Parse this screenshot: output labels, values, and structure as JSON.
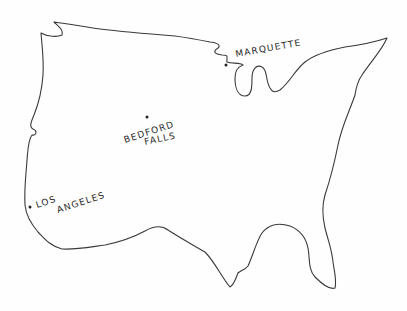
{
  "map": {
    "title": "",
    "style": "hand-drawn outline",
    "region": "United States (contiguous)",
    "outline_color": "#3a3a3a",
    "background_color": "#fefefe",
    "cities": [
      {
        "name": "MARQUETTE",
        "label_lines": [
          "MARQUETTE"
        ],
        "dot": [
          226,
          65
        ]
      },
      {
        "name": "BEDFORD FALLS",
        "label_lines": [
          "BEDFORD",
          "FALLS"
        ],
        "dot": [
          147,
          117
        ]
      },
      {
        "name": "LOS ANGELES",
        "label_lines": [
          "LOS",
          "ANGELES"
        ],
        "dot": [
          30,
          207
        ]
      }
    ]
  }
}
